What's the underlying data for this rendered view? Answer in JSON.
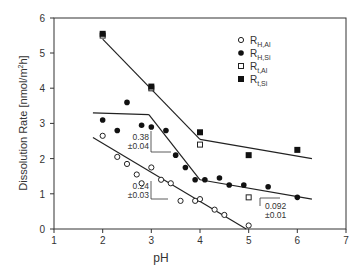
{
  "chart_data": {
    "type": "scatter",
    "title": "",
    "xlabel": "pH",
    "ylabel": "Dissolution Rate  [nmol/m²h]",
    "xlim": [
      1,
      7
    ],
    "ylim": [
      0,
      6
    ],
    "xticks": [
      1,
      2,
      3,
      4,
      5,
      6,
      7
    ],
    "yticks": [
      0,
      1,
      2,
      3,
      4,
      5,
      6
    ],
    "grid": false,
    "legend_position": "upper right",
    "series": [
      {
        "name": "R_H,Al",
        "marker": "open-circle",
        "x": [
          2.0,
          2.3,
          2.5,
          2.7,
          2.8,
          3.0,
          3.2,
          3.4,
          3.6,
          3.9,
          4.0,
          4.3,
          4.5,
          5.0
        ],
        "y": [
          2.65,
          2.05,
          1.85,
          1.55,
          1.3,
          1.75,
          1.4,
          1.3,
          0.8,
          0.8,
          0.85,
          0.55,
          0.4,
          0.1
        ]
      },
      {
        "name": "R_H,Si",
        "marker": "filled-circle",
        "x": [
          2.0,
          2.3,
          2.5,
          2.8,
          3.0,
          3.3,
          3.5,
          3.7,
          3.9,
          4.1,
          4.4,
          4.6,
          4.9,
          5.4,
          6.0
        ],
        "y": [
          3.1,
          2.8,
          3.6,
          2.95,
          2.9,
          2.8,
          2.1,
          1.75,
          1.4,
          1.4,
          1.45,
          1.25,
          1.25,
          1.2,
          0.9
        ]
      },
      {
        "name": "R_t,Al",
        "marker": "open-square",
        "x": [
          2.0,
          3.0,
          4.0,
          5.0
        ],
        "y": [
          5.5,
          4.0,
          2.4,
          0.9
        ]
      },
      {
        "name": "R_t,Si",
        "marker": "filled-square",
        "x": [
          2.0,
          3.0,
          4.0,
          5.0,
          6.0
        ],
        "y": [
          5.55,
          4.05,
          2.75,
          2.1,
          2.25
        ]
      }
    ],
    "fit_lines": [
      {
        "name": "R_t fit steep",
        "x": [
          2.0,
          4.0
        ],
        "y": [
          5.4,
          2.55
        ]
      },
      {
        "name": "R_t fit shallow",
        "x": [
          4.0,
          6.3
        ],
        "y": [
          2.55,
          2.0
        ]
      },
      {
        "name": "R_H,Si fit flat",
        "x": [
          1.8,
          2.95
        ],
        "y": [
          3.3,
          3.25
        ]
      },
      {
        "name": "R_H,Si fit steep",
        "x": [
          2.95,
          4.0
        ],
        "y": [
          3.25,
          1.4
        ]
      },
      {
        "name": "R_H,Si fit shallow",
        "x": [
          4.0,
          6.3
        ],
        "y": [
          1.4,
          0.85
        ]
      },
      {
        "name": "R_H,Al fit",
        "x": [
          1.8,
          4.95
        ],
        "y": [
          2.6,
          0.0
        ]
      }
    ],
    "annotations": [
      {
        "text": "0.38",
        "subtext": "±0.04",
        "x": 3.0,
        "y": 2.7
      },
      {
        "text": "0.24",
        "subtext": "±0.03",
        "x": 3.0,
        "y": 1.1
      },
      {
        "text": "0.092",
        "subtext": "±0.01",
        "x": 5.5,
        "y": 0.75
      }
    ]
  },
  "legend": [
    {
      "main": "R",
      "sub": "H,Al"
    },
    {
      "main": "R",
      "sub": "H,Si"
    },
    {
      "main": "R",
      "sub": "t,Al"
    },
    {
      "main": "R",
      "sub": "t,Si"
    }
  ],
  "slopes": [
    {
      "value": "0.38",
      "err": "±0.04"
    },
    {
      "value": "0.24",
      "err": "±0.03"
    },
    {
      "value": "0.092",
      "err": "±0.01"
    }
  ],
  "axes": {
    "xlabel": "pH",
    "ylabel": "Dissolution Rate  [nmol/m",
    "ylabel_sup": "2",
    "ylabel_end": "h]",
    "xticks": [
      "1",
      "2",
      "3",
      "4",
      "5",
      "6",
      "7"
    ],
    "yticks": [
      "0",
      "1",
      "2",
      "3",
      "4",
      "5",
      "6"
    ]
  }
}
